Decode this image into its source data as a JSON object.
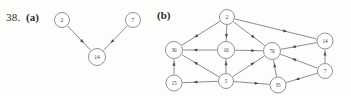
{
  "figure": {
    "problem_number": "38.",
    "parts": [
      {
        "id": "a",
        "label": "(a)",
        "graph": {
          "type": "directed-graph",
          "nodes": [
            {
              "id": "a2",
              "label": "2",
              "cx": 62,
              "cy": 20,
              "r": 7.5
            },
            {
              "id": "a7",
              "label": "7",
              "cx": 133,
              "cy": 20,
              "r": 7.5
            },
            {
              "id": "a14",
              "label": "14",
              "cx": 97,
              "cy": 57,
              "r": 8.5
            }
          ],
          "edges": [
            {
              "from": "a2",
              "to": "a14"
            },
            {
              "from": "a7",
              "to": "a14"
            }
          ]
        }
      },
      {
        "id": "b",
        "label": "(b)",
        "graph": {
          "type": "directed-graph",
          "nodes": [
            {
              "id": "b2",
              "label": "2",
              "cx": 227,
              "cy": 17,
              "r": 7.5
            },
            {
              "id": "b30",
              "label": "30",
              "cx": 174,
              "cy": 50,
              "r": 8.5
            },
            {
              "id": "b10",
              "label": "10",
              "cx": 226,
              "cy": 50,
              "r": 8.5
            },
            {
              "id": "b70",
              "label": "70",
              "cx": 272,
              "cy": 51,
              "r": 8.5
            },
            {
              "id": "b14",
              "label": "14",
              "cx": 325,
              "cy": 41,
              "r": 8.0
            },
            {
              "id": "b15",
              "label": "15",
              "cx": 174,
              "cy": 83,
              "r": 8.0
            },
            {
              "id": "b5",
              "label": "5",
              "cx": 226,
              "cy": 81,
              "r": 7.5
            },
            {
              "id": "b35",
              "label": "35",
              "cx": 278,
              "cy": 85,
              "r": 8.0
            },
            {
              "id": "b7",
              "label": "7",
              "cx": 325,
              "cy": 71,
              "r": 7.5
            }
          ],
          "edges": [
            {
              "from": "b2",
              "to": "b30"
            },
            {
              "from": "b2",
              "to": "b10"
            },
            {
              "from": "b2",
              "to": "b70"
            },
            {
              "from": "b2",
              "to": "b14"
            },
            {
              "from": "b10",
              "to": "b30"
            },
            {
              "from": "b10",
              "to": "b70"
            },
            {
              "from": "b15",
              "to": "b30"
            },
            {
              "from": "b5",
              "to": "b30"
            },
            {
              "from": "b5",
              "to": "b10"
            },
            {
              "from": "b5",
              "to": "b70"
            },
            {
              "from": "b5",
              "to": "b35"
            },
            {
              "from": "b5",
              "to": "b15"
            },
            {
              "from": "b35",
              "to": "b70"
            },
            {
              "from": "b7",
              "to": "b35"
            },
            {
              "from": "b7",
              "to": "b70"
            },
            {
              "from": "b7",
              "to": "b14"
            },
            {
              "from": "b14",
              "to": "b70"
            }
          ]
        }
      }
    ]
  },
  "colors": {
    "node_stroke": "#666666",
    "node_fill": "#fefefe",
    "edge_stroke": "#5b5b5b",
    "text": "#3a3a3a",
    "background": "#fdfdfc"
  }
}
